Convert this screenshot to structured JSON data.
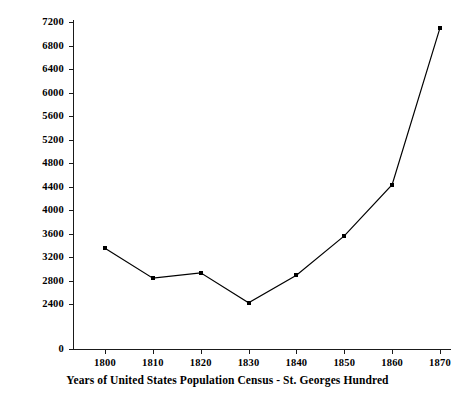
{
  "chart_data": {
    "type": "line",
    "title": "",
    "xlabel": "Years of United States Population Census - St. Georges Hundred",
    "ylabel": "Total Population of St. George's Hundred",
    "x": [
      1800,
      1810,
      1820,
      1830,
      1840,
      1850,
      1860,
      1870
    ],
    "values": [
      3350,
      2840,
      2930,
      2420,
      2890,
      3560,
      4430,
      7100
    ],
    "series": [
      {
        "name": "Total Population of St. George's Hundred",
        "values": [
          3350,
          2840,
          2930,
          2420,
          2890,
          3560,
          4430,
          7100
        ]
      }
    ],
    "xtick_labels": [
      "1800",
      "1810",
      "1820",
      "1830",
      "1840",
      "1850",
      "1860",
      "1870"
    ],
    "ytick_values": [
      0,
      2400,
      2800,
      3200,
      3600,
      4000,
      4400,
      4800,
      5200,
      5600,
      6000,
      6400,
      6800,
      7200
    ],
    "ytick_labels": [
      "0",
      "2400",
      "2800",
      "3200",
      "3600",
      "4000",
      "4400",
      "4800",
      "5200",
      "5600",
      "6000",
      "6400",
      "6800",
      "7200"
    ],
    "xlim": [
      1795,
      1875
    ],
    "ylim": [
      2400,
      7200
    ],
    "y_axis_break": true,
    "y_axis_break_note": "Axis is broken between 0 and 2400",
    "grid": false,
    "legend": "none",
    "line_color": "#000000",
    "marker": "square",
    "marker_color": "#000000",
    "axis_color": "#1a1a1a",
    "background_color": "#ffffff"
  }
}
